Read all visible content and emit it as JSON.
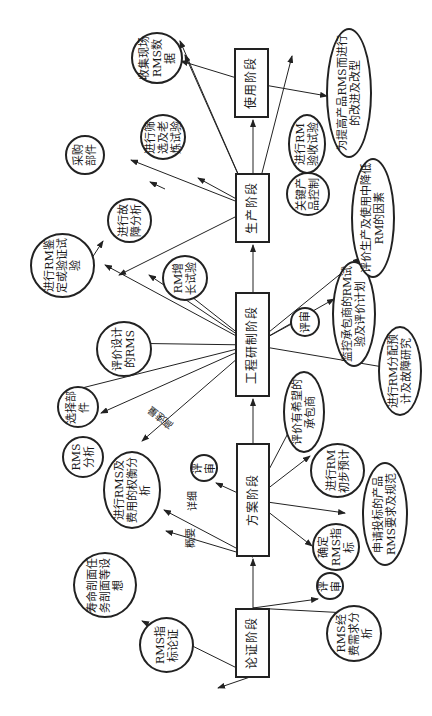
{
  "diagram": {
    "stages": [
      {
        "id": "s1",
        "label": "论证阶段"
      },
      {
        "id": "s2",
        "label": "方案阶段"
      },
      {
        "id": "s3",
        "label": "工程研制阶段"
      },
      {
        "id": "s4",
        "label": "生产阶段"
      },
      {
        "id": "s5",
        "label": "使用阶段"
      }
    ],
    "nodes": {
      "n_rms_index_demo": "RMS指标论证",
      "n_life_profile": "寿命剖面任务剖面等设想",
      "n_review1": "评审",
      "n_rms_cost_req": "RMS经费需求分析",
      "n_tradeoff": "进行RMS及费用的权衡分析",
      "n_review2": "评审",
      "n_determine_rms": "确定RMS指标",
      "n_bid_spec": "申请投标的产品RMS要求及规范",
      "n_rm_prelim": "进行RM初步预计",
      "n_eval_subcontractor": "评价有希望的承包商",
      "n_rms_analysis": "RMS分析",
      "n_select_parts": "选择部件",
      "n_eval_design": "评价设计的RMS",
      "n_rm_qual_test": "进行RM鉴定或验证试验",
      "n_rm_growth": "RM增长试验",
      "n_failure_analysis": "进行故障分析",
      "n_review3": "评审",
      "n_monitor_sub": "监控承包商的RM试验及评价计划",
      "n_rm_alloc": "进行RM分配预计及故障研究",
      "n_eval_degrade": "评价生产及使用中降低RM的因素",
      "n_purchase_parts": "采购部件",
      "n_screen_burnin": "进行筛选及老炼试验",
      "n_rm_acceptance": "进行RM验收试验",
      "n_key_product": "关键产品控制",
      "n_collect_field": "收集现场RMS数据",
      "n_improve": "为提高产品RMS而进行的改进及改型"
    },
    "edge_labels": {
      "summary": "概要",
      "detailed": "详细",
      "high_speed": "高速量"
    },
    "colors": {
      "line": "#222222",
      "background": "#ffffff"
    }
  }
}
